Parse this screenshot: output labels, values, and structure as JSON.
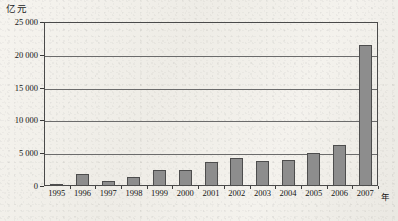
{
  "chart_data": {
    "type": "bar",
    "title": "",
    "subtitle": "",
    "unit_label": "亿元",
    "xlabel": "年",
    "ylabel": "",
    "categories": [
      "1995",
      "1996",
      "1997",
      "1998",
      "1999",
      "2000",
      "2001",
      "2002",
      "2003",
      "2004",
      "2005",
      "2006",
      "2007"
    ],
    "values": [
      210,
      1900,
      700,
      1450,
      2400,
      2400,
      3700,
      4300,
      3800,
      4000,
      5000,
      6300,
      21500
    ],
    "ylim": [
      0,
      25000
    ],
    "yticks": [
      0,
      5000,
      10000,
      15000,
      20000,
      25000
    ],
    "ytick_labels": [
      "0",
      "5 000",
      "10 000",
      "15 000",
      "20 000",
      "25 000"
    ],
    "grid": true,
    "grid_axis": "y",
    "legend": "none",
    "series": [
      {
        "name": "",
        "values": [
          210,
          1900,
          700,
          1450,
          2400,
          2400,
          3700,
          4300,
          3800,
          4000,
          5000,
          6300,
          21500
        ],
        "color": "#8d8d8d",
        "edge_color": "#4d4d4d"
      }
    ],
    "colors": {
      "bar_fill": "#8d8d8d",
      "bar_edge": "#4d4d4d",
      "axis": "#4a4a4a",
      "gridline": "#6b6b6b",
      "text": "#141414",
      "background": "#f3f1ec"
    }
  }
}
